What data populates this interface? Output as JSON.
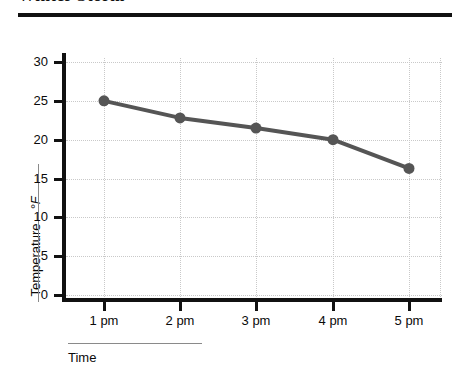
{
  "title": "Winter Storm",
  "chart_data": {
    "type": "line",
    "title": "Winter Storm",
    "xlabel": "Time",
    "ylabel": "Temperature",
    "ylabel_unit": "°F",
    "categories": [
      "1 pm",
      "2 pm",
      "3 pm",
      "4 pm",
      "5 pm"
    ],
    "values": [
      25,
      22.8,
      21.5,
      20,
      16.3
    ],
    "series": [
      {
        "name": "Temperature",
        "values": [
          25,
          22.8,
          21.5,
          20,
          16.3
        ]
      }
    ],
    "ylim": [
      0,
      32
    ],
    "yticks": [
      0,
      5,
      10,
      15,
      20,
      25,
      30
    ],
    "ytick_labels": [
      "0",
      "5",
      "10",
      "15",
      "20",
      "25",
      "30"
    ],
    "xtick_labels": [
      "1 pm",
      "2 pm",
      "3 pm",
      "4 pm",
      "5 pm"
    ],
    "grid": true,
    "legend": false,
    "series_color": "#555555",
    "marker": "circle",
    "axis_color": "#111111",
    "grid_color": "#c9c9c9"
  }
}
